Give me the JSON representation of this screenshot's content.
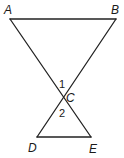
{
  "diagram": {
    "type": "geometry",
    "points": {
      "A": {
        "label": "A",
        "x": 10,
        "y": 19
      },
      "B": {
        "label": "B",
        "x": 116,
        "y": 19
      },
      "C": {
        "label": "C",
        "x": 63,
        "y": 97
      },
      "D": {
        "label": "D",
        "x": 37,
        "y": 137
      },
      "E": {
        "label": "E",
        "x": 91,
        "y": 137
      }
    },
    "segments": [
      "AB",
      "AE",
      "BD",
      "DE"
    ],
    "angles": [
      {
        "label": "1",
        "vertex": "C",
        "description": "angle ACB"
      },
      {
        "label": "2",
        "vertex": "C",
        "description": "angle DCE"
      }
    ],
    "labels": {
      "A": "A",
      "B": "B",
      "C": "C",
      "D": "D",
      "E": "E",
      "angle1": "1",
      "angle2": "2"
    }
  }
}
